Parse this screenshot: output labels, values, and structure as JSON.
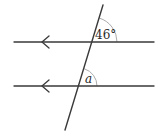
{
  "diagram": {
    "type": "parallel-lines-transversal",
    "lines": [
      {
        "id": "upper-parallel-line",
        "arrow_direction": "left"
      },
      {
        "id": "lower-parallel-line",
        "arrow_direction": "left"
      }
    ],
    "transversal": {
      "id": "transversal"
    },
    "angles": [
      {
        "id": "upper-angle",
        "label": "46°",
        "position": "upper intersection, above line, right of transversal"
      },
      {
        "id": "lower-angle",
        "label": "a",
        "position": "lower intersection, above line, right of transversal"
      }
    ],
    "colors": {
      "line": "#3a3a3a",
      "arc": "#a0a0a0",
      "text": "#2a2a2a"
    }
  }
}
